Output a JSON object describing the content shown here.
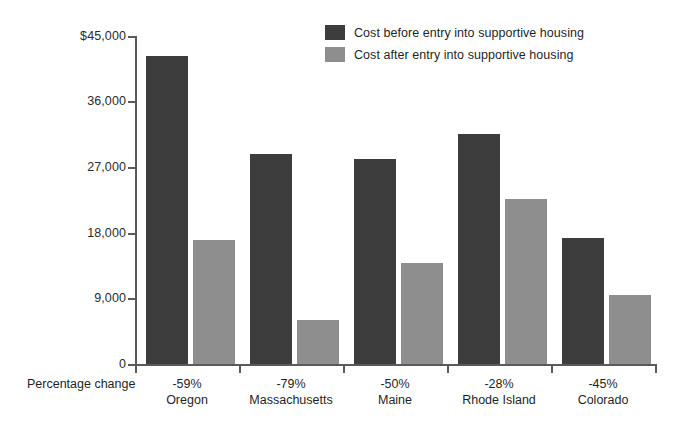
{
  "chart_data": {
    "type": "bar",
    "title": "",
    "subtitle": "",
    "xlabel": "Percentage change",
    "ylabel": "",
    "ylim": [
      0,
      45000
    ],
    "yticks": [
      0,
      9000,
      18000,
      27000,
      36000,
      45000
    ],
    "ytick_labels": [
      "0",
      "9,000",
      "18,000",
      "27,000",
      "36,000",
      "$45,000"
    ],
    "grid": false,
    "legend_position": "top-center",
    "categories": [
      "Oregon",
      "Massachusetts",
      "Maine",
      "Rhode Island",
      "Colorado"
    ],
    "category_annotations": [
      "-59%",
      "-79%",
      "-50%",
      "-28%",
      "-45%"
    ],
    "series": [
      {
        "name": "Cost before entry into supportive housing",
        "color": "#3d3d3d",
        "values": [
          42200,
          28800,
          28100,
          31600,
          17300
        ]
      },
      {
        "name": "Cost after entry into supportive housing",
        "color": "#8e8e8e",
        "values": [
          17000,
          6000,
          13800,
          22700,
          9500
        ]
      }
    ]
  },
  "axis": {
    "caption": "Percentage change",
    "y_labels": [
      "$45,000",
      "36,000",
      "27,000",
      "18,000",
      "9,000",
      "0"
    ]
  },
  "legend": {
    "items": [
      {
        "label": "Cost before entry into supportive housing",
        "color": "#3d3d3d"
      },
      {
        "label": "Cost after entry into supportive housing",
        "color": "#8e8e8e"
      }
    ]
  },
  "categories": [
    {
      "pct": "-59%",
      "name": "Oregon"
    },
    {
      "pct": "-79%",
      "name": "Massachusetts"
    },
    {
      "pct": "-50%",
      "name": "Maine"
    },
    {
      "pct": "-28%",
      "name": "Rhode Island"
    },
    {
      "pct": "-45%",
      "name": "Colorado"
    }
  ]
}
